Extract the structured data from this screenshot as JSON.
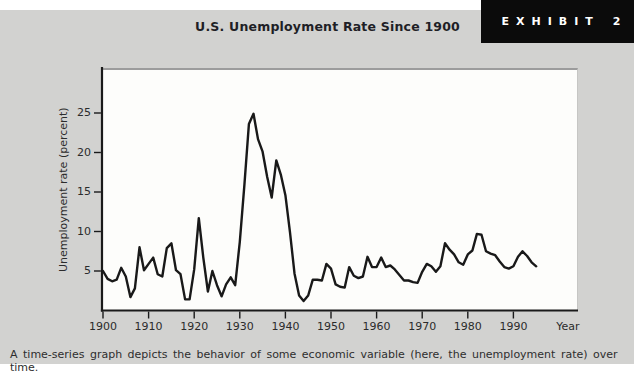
{
  "title": "U.S. Unemployment Rate Since 1900",
  "exhibit": {
    "label": "EXHIBIT",
    "number": "2"
  },
  "caption": "A time-series graph depicts the behavior of some economic variable (here, the unemployment rate) over time.",
  "colors": {
    "band_background": "#d2d2d0",
    "plot_background": "#fdfdfb",
    "exhibit_box": "#0b0b0b",
    "exhibit_text": "#ffffff",
    "line": "#191919",
    "axis": "#1a1a1a",
    "text": "#2b2b2b",
    "title_text": "#1f1f26"
  },
  "chart_data": {
    "type": "line",
    "title": "U.S. Unemployment Rate Since 1900",
    "xlabel": "Year",
    "ylabel": "Unemployment rate (percent)",
    "x_ticks": [
      1900,
      1910,
      1920,
      1930,
      1940,
      1950,
      1960,
      1970,
      1980,
      1990
    ],
    "y_ticks": [
      5,
      10,
      15,
      20,
      25
    ],
    "xlim": [
      1900,
      2004
    ],
    "ylim": [
      0,
      30
    ],
    "grid": false,
    "legend": "none",
    "series": [
      {
        "name": "U.S. unemployment rate (percent)",
        "x": [
          1900,
          1901,
          1902,
          1903,
          1904,
          1905,
          1906,
          1907,
          1908,
          1909,
          1910,
          1911,
          1912,
          1913,
          1914,
          1915,
          1916,
          1917,
          1918,
          1919,
          1920,
          1921,
          1922,
          1923,
          1924,
          1925,
          1926,
          1927,
          1928,
          1929,
          1930,
          1931,
          1932,
          1933,
          1934,
          1935,
          1936,
          1937,
          1938,
          1939,
          1940,
          1941,
          1942,
          1943,
          1944,
          1945,
          1946,
          1947,
          1948,
          1949,
          1950,
          1951,
          1952,
          1953,
          1954,
          1955,
          1956,
          1957,
          1958,
          1959,
          1960,
          1961,
          1962,
          1963,
          1964,
          1965,
          1966,
          1967,
          1968,
          1969,
          1970,
          1971,
          1972,
          1973,
          1974,
          1975,
          1976,
          1977,
          1978,
          1979,
          1980,
          1981,
          1982,
          1983,
          1984,
          1985,
          1986,
          1987,
          1988,
          1989,
          1990,
          1991,
          1992,
          1993,
          1994,
          1995
        ],
        "values": [
          5.0,
          4.0,
          3.7,
          3.9,
          5.4,
          4.3,
          1.7,
          2.8,
          8.0,
          5.1,
          5.9,
          6.7,
          4.6,
          4.3,
          7.9,
          8.5,
          5.1,
          4.6,
          1.4,
          1.4,
          5.2,
          11.7,
          6.7,
          2.4,
          5.0,
          3.2,
          1.8,
          3.3,
          4.2,
          3.2,
          8.7,
          15.9,
          23.6,
          24.9,
          21.7,
          20.1,
          16.9,
          14.3,
          19.0,
          17.2,
          14.6,
          9.9,
          4.7,
          1.9,
          1.2,
          1.9,
          3.9,
          3.9,
          3.8,
          5.9,
          5.3,
          3.3,
          3.0,
          2.9,
          5.5,
          4.4,
          4.1,
          4.3,
          6.8,
          5.5,
          5.5,
          6.7,
          5.5,
          5.7,
          5.2,
          4.5,
          3.8,
          3.8,
          3.6,
          3.5,
          4.9,
          5.9,
          5.6,
          4.9,
          5.6,
          8.5,
          7.7,
          7.1,
          6.1,
          5.8,
          7.1,
          7.6,
          9.7,
          9.6,
          7.5,
          7.2,
          7.0,
          6.2,
          5.5,
          5.3,
          5.6,
          6.8,
          7.5,
          6.9,
          6.1,
          5.6
        ]
      }
    ]
  }
}
